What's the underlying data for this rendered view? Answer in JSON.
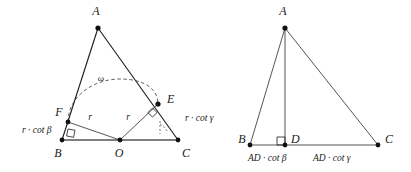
{
  "figure": {
    "title": "",
    "background": "#ffffff",
    "ink": "#1a1a1a",
    "width": 411,
    "height": 172,
    "panels": [
      {
        "id": "left-panel",
        "name": "incircle-triangle-diagram",
        "vertices": [
          {
            "name": "A",
            "label": "A",
            "x": 98,
            "y": 28,
            "label_x": 96,
            "label_y": 15
          },
          {
            "name": "B",
            "label": "B",
            "x": 62,
            "y": 140,
            "label_x": 58,
            "label_y": 154
          },
          {
            "name": "C",
            "label": "C",
            "x": 178,
            "y": 140,
            "label_x": 184,
            "label_y": 154
          },
          {
            "name": "O",
            "label": "O",
            "x": 120,
            "y": 140,
            "label_x": 117,
            "label_y": 154
          },
          {
            "name": "E",
            "label": "E",
            "x": 158,
            "y": 104,
            "label_x": 165,
            "label_y": 101
          },
          {
            "name": "F",
            "label": "F",
            "x": 68,
            "y": 122,
            "label_x": 59,
            "label_y": 114
          }
        ],
        "segment_labels": [
          {
            "name": "radius-OF",
            "text": "r",
            "x": 90,
            "y": 119
          },
          {
            "name": "radius-OE",
            "text": "r",
            "x": 127,
            "y": 119
          },
          {
            "name": "tangent-BF",
            "text": "r · cot β",
            "x": 22,
            "y": 133
          },
          {
            "name": "tangent-CE",
            "text": "r · cot γ",
            "x": 185,
            "y": 121
          },
          {
            "name": "arc-angle",
            "text": "ω",
            "x": 101,
            "y": 80
          }
        ]
      },
      {
        "id": "right-panel",
        "name": "altitude-triangle-diagram",
        "vertices": [
          {
            "name": "A",
            "label": "A",
            "x": 285,
            "y": 28,
            "label_x": 282,
            "label_y": 15
          },
          {
            "name": "B",
            "label": "B",
            "x": 250,
            "y": 145,
            "label_x": 243,
            "label_y": 141
          },
          {
            "name": "D",
            "label": "D",
            "x": 285,
            "y": 145,
            "label_x": 290,
            "label_y": 141
          },
          {
            "name": "C",
            "label": "C",
            "x": 378,
            "y": 145,
            "label_x": 384,
            "label_y": 141
          }
        ],
        "segment_labels": [
          {
            "name": "base-BD",
            "text": "AD · cot β",
            "x": 248,
            "y": 161
          },
          {
            "name": "base-DC",
            "text": "AD · cot γ",
            "x": 313,
            "y": 161
          }
        ]
      }
    ]
  }
}
